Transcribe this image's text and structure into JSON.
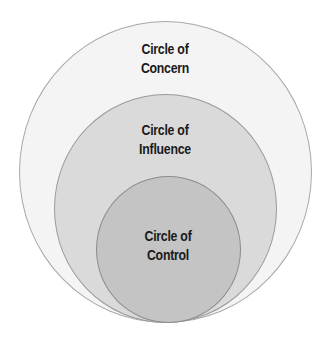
{
  "diagram": {
    "circles": [
      {
        "name": "concern",
        "line1": "Circle of",
        "line2": "Concern",
        "fill": "#f4f4f4",
        "stroke": "#a8a8a8"
      },
      {
        "name": "influence",
        "line1": "Circle of",
        "line2": "Influence",
        "fill": "#dadada",
        "stroke": "#9a9a9a"
      },
      {
        "name": "control",
        "line1": "Circle of",
        "line2": "Control",
        "fill": "#c4c4c4",
        "stroke": "#8c8c8c"
      }
    ]
  }
}
